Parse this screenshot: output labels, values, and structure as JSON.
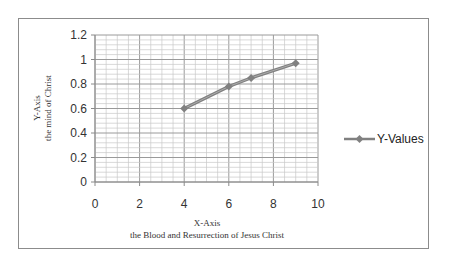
{
  "chart_data": {
    "type": "scatter",
    "title": "",
    "xlabel": "X-Axis",
    "xlabel_sub": "the Blood and Resurrection of Jesus Christ",
    "ylabel": "Y-Axis",
    "ylabel_sub": "the mind of Christ",
    "xlim": [
      0,
      10
    ],
    "ylim": [
      0,
      1.2
    ],
    "xticks": [
      0,
      2,
      4,
      6,
      8,
      10
    ],
    "yticks": [
      0,
      0.2,
      0.4,
      0.6,
      0.8,
      1,
      1.2
    ],
    "xtick_labels": [
      "0",
      "2",
      "4",
      "6",
      "8",
      "10"
    ],
    "ytick_labels": [
      "0",
      "0.2",
      "0.4",
      "0.6",
      "0.8",
      "1",
      "1.2"
    ],
    "grid": true,
    "legend_position": "right",
    "series": [
      {
        "name": "Y-Values",
        "color": "#808080",
        "marker": "diamond",
        "x": [
          4,
          6,
          7,
          9
        ],
        "y": [
          0.6,
          0.78,
          0.85,
          0.97
        ]
      }
    ]
  }
}
